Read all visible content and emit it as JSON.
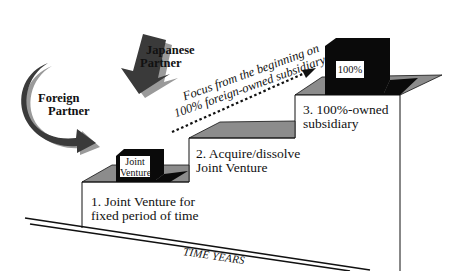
{
  "diagram": {
    "partners": [
      {
        "label_line1": "Foreign",
        "label_line2": "Partner"
      },
      {
        "label_line1": "Japanese",
        "label_line2": "Partner"
      }
    ],
    "focus_annotation": {
      "line1": "Focus from the beginning on",
      "line2": "100% foreign-owned subsidiary"
    },
    "steps": [
      {
        "line1": "1. Joint Venture for",
        "line2": "fixed period of time"
      },
      {
        "line1": "2. Acquire/dissolve",
        "line2": "Joint Venture"
      },
      {
        "line1": "3. 100%-owned",
        "line2": "subsidiary"
      }
    ],
    "cubes": [
      {
        "line1": "Joint",
        "line2": "Venture"
      },
      {
        "line1": "100%"
      }
    ],
    "axis_label": "TIME YEARS",
    "colors": {
      "black_cube": "#0a0a0a",
      "step_top": "#8c8c8c",
      "arrow_dark": "#3a3a3a",
      "arrow_light": "#9a9a9a",
      "line": "#111111"
    }
  }
}
